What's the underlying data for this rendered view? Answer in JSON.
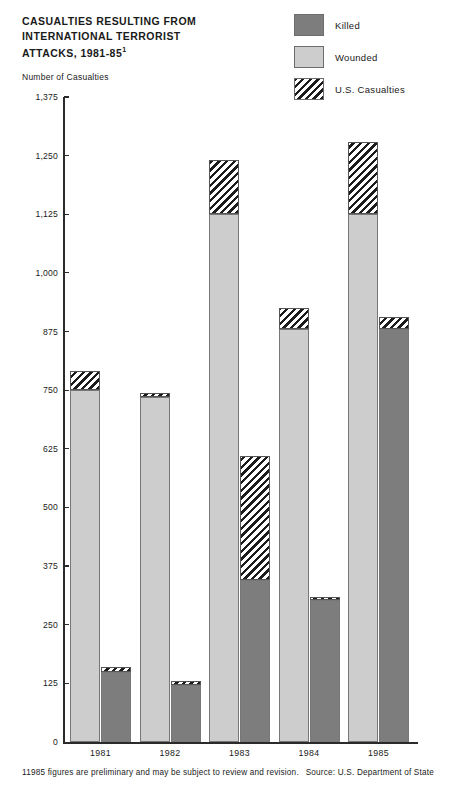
{
  "title": {
    "text": "CASUALTIES RESULTING FROM INTERNATIONAL TERRORIST ATTACKS, 1981-85",
    "footnote_marker": "1"
  },
  "axis_label": "Number of Casualties",
  "legend": {
    "items": [
      {
        "label": "Killed",
        "swatch": "solid-dark-gray",
        "color": "#7d7d7d"
      },
      {
        "label": "Wounded",
        "swatch": "solid-light-gray",
        "color": "#cdcdcd"
      },
      {
        "label": "U.S. Casualties",
        "swatch": "diagonal-hatch",
        "color": "#1c1c1c"
      }
    ]
  },
  "footer": {
    "footnote_marker": "1",
    "footnote": "1985 figures are preliminary and may be subject to review and revision.",
    "source": "Source: U.S. Department of State"
  },
  "chart_data": {
    "type": "bar",
    "title": "Casualties Resulting from International Terrorist Attacks, 1981-85",
    "xlabel": "",
    "ylabel": "Number of Casualties",
    "ylim": [
      0,
      1375
    ],
    "yticks": [
      0,
      125,
      250,
      375,
      500,
      625,
      750,
      875,
      1000,
      1125,
      1250,
      1375
    ],
    "ytick_labels": [
      "0",
      "125",
      "250",
      "375",
      "500",
      "625",
      "750",
      "875",
      "1,000",
      "1,125",
      "1,250",
      "1,375"
    ],
    "grid": false,
    "legend_position": "top-right",
    "categories": [
      "1981",
      "1982",
      "1983",
      "1984",
      "1985"
    ],
    "series": [
      {
        "name": "Wounded",
        "values": [
          790,
          745,
          1240,
          925,
          1280
        ],
        "us_casualties_segment_from": [
          750,
          735,
          1125,
          880,
          1125
        ]
      },
      {
        "name": "Killed",
        "values": [
          160,
          130,
          610,
          310,
          905
        ],
        "us_casualties_segment_from": [
          150,
          122,
          345,
          303,
          880
        ]
      }
    ]
  }
}
